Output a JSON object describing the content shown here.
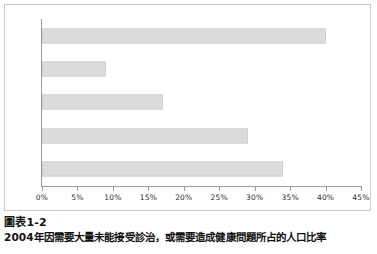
{
  "chart_data": {
    "type": "bar",
    "orientation": "horizontal",
    "title": "",
    "xlabel": "",
    "ylabel": "",
    "categories": [
      "美國",
      "英國",
      "加拿大",
      "澳洲",
      "紐西蘭"
    ],
    "values": [
      40,
      9,
      17,
      29,
      34
    ],
    "value_suffix": "%",
    "xlim": [
      0,
      45
    ],
    "xticks": [
      0,
      5,
      10,
      15,
      20,
      25,
      30,
      35,
      40,
      45
    ],
    "xtick_labels": [
      "0%",
      "5%",
      "10%",
      "15%",
      "20%",
      "25%",
      "30%",
      "35%",
      "40%",
      "45%"
    ],
    "grid": false,
    "legend": false,
    "bar_color": "#dcdcdc",
    "bar_border_color": "#cfcfcf",
    "axis_color": "#9a9a9a"
  },
  "caption": {
    "title": "圖表1-2",
    "subtitle": "2004年因需要大量未能接受診治，或需要造成健康問題所占的人口比率"
  }
}
